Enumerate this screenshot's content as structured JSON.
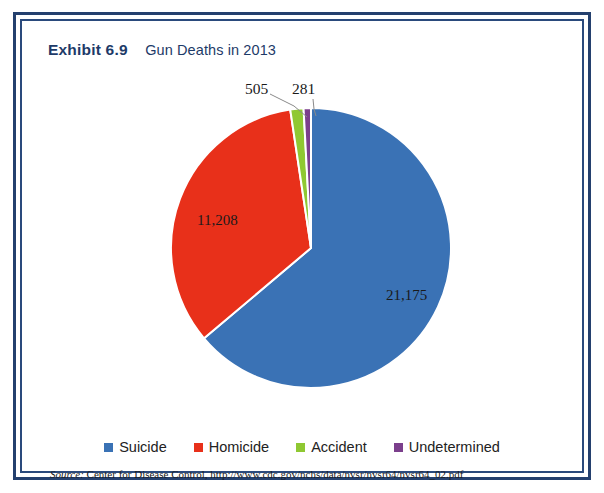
{
  "exhibit": {
    "number": "Exhibit 6.9",
    "title": "Gun Deaths in 2013"
  },
  "source": {
    "prefix": "Source:",
    "text": " Center for Disease Control, http://www.cdc.gov/nchs/data/nvsr/nvsr64/nvsr64_02.pdf"
  },
  "colors": {
    "frame": "#24406e",
    "frame_inner": "#2a4a7c",
    "heading": "#1d3a68",
    "suicide": "#3a72b5",
    "homicide": "#e8301a",
    "accident": "#8fc832",
    "undetermined": "#7b3f8c",
    "background": "#ffffff",
    "leader": "#8a8a8a"
  },
  "chart_data": {
    "type": "pie",
    "title": "Gun Deaths in 2013",
    "categories": [
      "Suicide",
      "Homicide",
      "Accident",
      "Undetermined"
    ],
    "values": [
      21175,
      11208,
      505,
      281
    ],
    "value_labels": [
      "21,175",
      "11,208",
      "505",
      "281"
    ],
    "colors": [
      "#3a72b5",
      "#e8301a",
      "#8fc832",
      "#7b3f8c"
    ],
    "total": 33169,
    "percentages": [
      63.8,
      33.8,
      1.5,
      0.8
    ],
    "start_angle_deg": 0,
    "direction": "clockwise",
    "legend_position": "bottom",
    "grid": false,
    "xlabel": "",
    "ylabel": "",
    "label_placement": [
      "inside",
      "inside",
      "callout",
      "callout"
    ]
  },
  "legend": {
    "items": [
      {
        "label": "Suicide",
        "color": "#3a72b5"
      },
      {
        "label": "Homicide",
        "color": "#e8301a"
      },
      {
        "label": "Accident",
        "color": "#8fc832"
      },
      {
        "label": "Undetermined",
        "color": "#7b3f8c"
      }
    ]
  }
}
